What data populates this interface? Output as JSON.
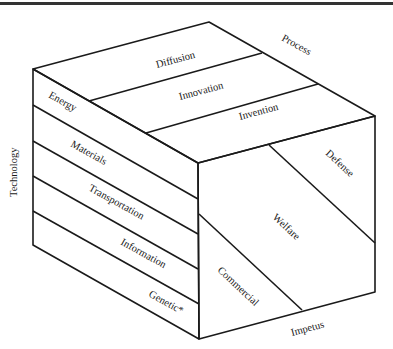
{
  "figure": {
    "type": "three-dimensional technology cube",
    "axes": {
      "vertical": "Technology",
      "depth": "Process",
      "horizontal": "Impetus"
    },
    "top_face": {
      "axis": "Process",
      "segments": [
        "Diffusion",
        "Innovation",
        "Invention"
      ]
    },
    "left_face": {
      "axis": "Technology",
      "segments": [
        "Energy",
        "Materials",
        "Transportation",
        "Information",
        "Genetic*"
      ]
    },
    "front_face": {
      "axis": "Impetus",
      "segments": [
        "Commercial",
        "Welfare",
        "Defense"
      ]
    }
  }
}
